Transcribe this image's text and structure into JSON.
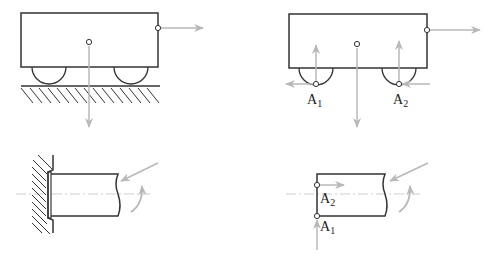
{
  "diagram": {
    "type": "free-body-diagrams",
    "colors": {
      "line": "#333333",
      "force_arrow": "#b8b8b8",
      "axis": "#cccccc",
      "background": "#ffffff"
    },
    "panels": [
      {
        "id": "cart-on-ground",
        "description": "Cart with two wheels on hatched ground, external horizontal force and weight",
        "labels": []
      },
      {
        "id": "cart-free-body",
        "description": "Cart free body with reaction forces at wheel contacts",
        "labels": [
          {
            "main": "A",
            "sub": "1"
          },
          {
            "main": "A",
            "sub": "2"
          }
        ]
      },
      {
        "id": "beam-fixed-support",
        "description": "Beam clamped to hatched wall with applied force and moment at cut end",
        "labels": []
      },
      {
        "id": "beam-free-body",
        "description": "Beam free body with reactions at A1 and A2",
        "labels": [
          {
            "main": "A",
            "sub": "2"
          },
          {
            "main": "A",
            "sub": "1"
          }
        ]
      }
    ]
  }
}
